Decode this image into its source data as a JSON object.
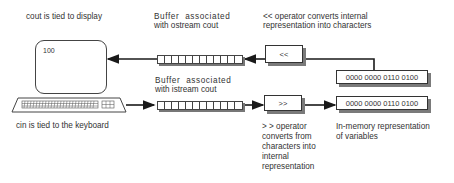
{
  "labels": {
    "cout_display": "cout is tied to display",
    "cin_keyboard": "cin is tied to the keyboard",
    "ostream_buffer_line1": "Buffer  associated",
    "ostream_buffer_line2": "with ostream cout",
    "istream_buffer_line1": "Buffer  associated",
    "istream_buffer_line2": "with istream cout",
    "output_op_line1": "<< operator converts internal",
    "output_op_line2": "representation into characters",
    "input_op_lines": [
      "> > operator",
      "converts from",
      "characters into",
      "internal",
      "representation"
    ],
    "memory_line1": "In-memory representation",
    "memory_line2": "of variables"
  },
  "nodes": {
    "display_value": "100",
    "output_operator": "<<",
    "input_operator": ">>",
    "memory_top": "0000 0000 0110 0100",
    "memory_bottom": "0000 0000 0110 0100"
  },
  "buffers": {
    "cells": 9
  },
  "colors": {
    "line": "#1a1a1a",
    "shadow": "#7a7a7a",
    "text": "#333333"
  }
}
